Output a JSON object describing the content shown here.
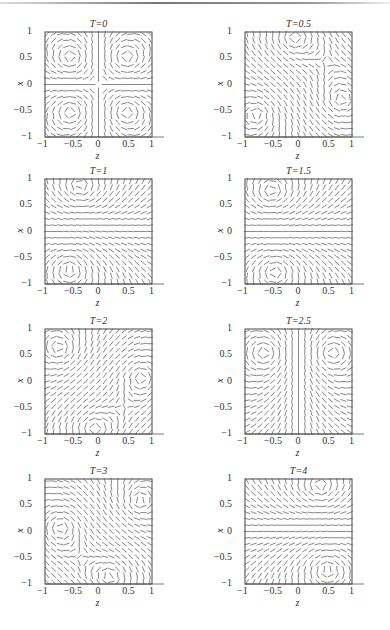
{
  "figure": {
    "panels": [
      {
        "title": "T=0",
        "left": 0,
        "top": 18
      },
      {
        "title": "T=0.5",
        "left": 200,
        "top": 18
      },
      {
        "title": "T=1",
        "left": 0,
        "top": 165
      },
      {
        "title": "T=1.5",
        "left": 200,
        "top": 165
      },
      {
        "title": "T=2",
        "left": 0,
        "top": 315
      },
      {
        "title": "T=2.5",
        "left": 200,
        "top": 315
      },
      {
        "title": "T=3",
        "left": 0,
        "top": 465
      },
      {
        "title": "T=4",
        "left": 200,
        "top": 465
      }
    ],
    "xticks": [
      "−1",
      "−0.5",
      "0",
      "0.5",
      "1"
    ],
    "yticks": [
      "1",
      "0.5",
      "0",
      "−0.5",
      "−1"
    ],
    "xlabel": "z",
    "ylabel": "x"
  },
  "chart_data": {
    "type": "vector_field_grid",
    "title": "",
    "xlabel": "z",
    "ylabel": "x",
    "xlim": [
      -1,
      1
    ],
    "ylim": [
      -1,
      1
    ],
    "xticks": [
      -1,
      -0.5,
      0,
      0.5,
      1
    ],
    "yticks": [
      -1,
      -0.5,
      0,
      0.5,
      1
    ],
    "grid": false,
    "legend": null,
    "layout": {
      "rows": 4,
      "cols": 2
    },
    "panels": [
      {
        "title": "T=0",
        "T": 0,
        "pattern": "four symmetric vortices with vertical line at z=0 and horizontal line at x=0",
        "vortices": [
          {
            "z": -0.5,
            "x": 0.5,
            "s": 1
          },
          {
            "z": 0.5,
            "x": 0.5,
            "s": -1
          },
          {
            "z": -0.5,
            "x": -0.5,
            "s": -1
          },
          {
            "z": 0.5,
            "x": -0.5,
            "s": 1
          }
        ]
      },
      {
        "title": "T=0.5",
        "T": 0.5,
        "pattern": "vortex lower-left, diagonal flow, singular point right edge",
        "vortices": [
          {
            "z": -0.75,
            "x": -0.55,
            "s": 1
          },
          {
            "z": 0.8,
            "x": -0.3,
            "s": -1
          },
          {
            "z": -0.1,
            "x": 0.9,
            "s": -1
          }
        ]
      },
      {
        "title": "T=1",
        "T": 1,
        "pattern": "vortices upper-left and lower-left, horizontal flow center, singular line near z=0.85",
        "vortices": [
          {
            "z": -0.35,
            "x": 0.85,
            "s": 1
          },
          {
            "z": -0.55,
            "x": -0.7,
            "s": -1
          }
        ]
      },
      {
        "title": "T=1.5",
        "T": 1.5,
        "pattern": "vortices upper-left and lower-left, horizontal flow center",
        "vortices": [
          {
            "z": -0.5,
            "x": 0.75,
            "s": 1
          },
          {
            "z": -0.45,
            "x": -0.75,
            "s": -1
          }
        ]
      },
      {
        "title": "T=2",
        "T": 2,
        "pattern": "vortex upper-left, diagonal flow, singular region at right edge",
        "vortices": [
          {
            "z": -0.7,
            "x": 0.6,
            "s": -1
          },
          {
            "z": 0.8,
            "x": 0.1,
            "s": 1
          },
          {
            "z": -0.1,
            "x": -0.9,
            "s": 1
          }
        ]
      },
      {
        "title": "T=2.5",
        "T": 2.5,
        "pattern": "two upper vortices, vertical flow through center, symmetric about z=0",
        "vortices": [
          {
            "z": -0.6,
            "x": 0.55,
            "s": 1
          },
          {
            "z": 0.6,
            "x": 0.55,
            "s": -1
          }
        ]
      },
      {
        "title": "T=3",
        "T": 3,
        "pattern": "vortex upper-right, diagonal flow, singular point bottom center",
        "vortices": [
          {
            "z": 0.75,
            "x": 0.55,
            "s": -1
          },
          {
            "z": -0.7,
            "x": 0.1,
            "s": 1
          },
          {
            "z": 0.25,
            "x": -0.85,
            "s": 1
          }
        ]
      },
      {
        "title": "T=4",
        "T": 4,
        "pattern": "vortices upper and lower-right, horizontal flow center, singular line near z=-0.85",
        "vortices": [
          {
            "z": 0.4,
            "x": 0.85,
            "s": -1
          },
          {
            "z": 0.55,
            "x": -0.7,
            "s": 1
          }
        ]
      }
    ]
  }
}
